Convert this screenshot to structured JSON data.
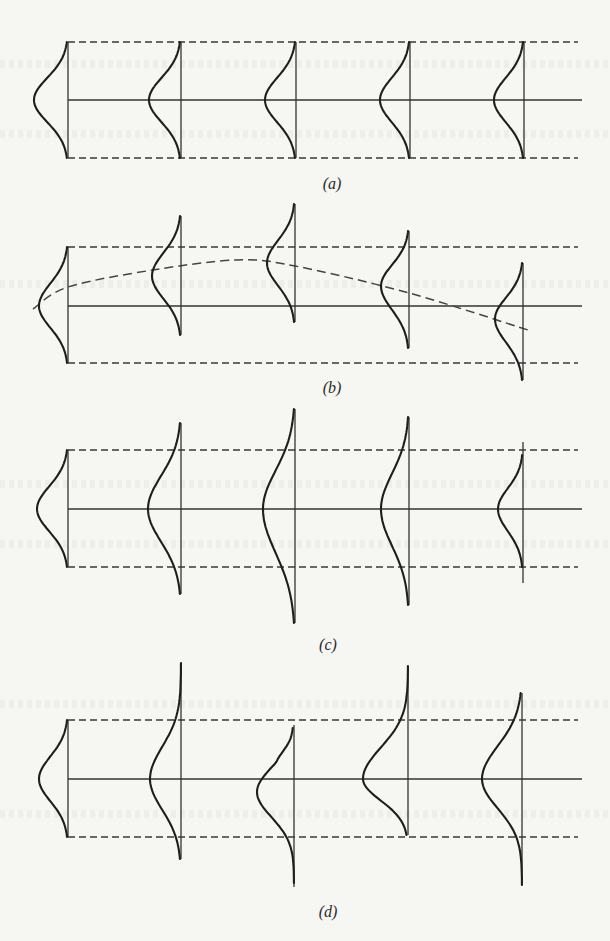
{
  "figure": {
    "width": 610,
    "height": 941,
    "line_color": "#333333",
    "curve_color": "#1e1e1e",
    "background": "#f6f6f3",
    "panels": [
      {
        "id": "a",
        "label": "(a)",
        "label_pos": [
          332,
          184
        ],
        "upper_bound_y": 42,
        "center_y": 100,
        "lower_bound_y": 158,
        "x_start": 68,
        "x_end_dashed": 578,
        "x_end_center": 582,
        "trend": null,
        "distributions": [
          {
            "x": 68,
            "v_top": 42,
            "v_bot": 158,
            "peak_x": 34,
            "peak_y": 100,
            "c_top": 42,
            "c_bot": 158
          },
          {
            "x": 181,
            "v_top": 42,
            "v_bot": 158,
            "peak_x": 149,
            "peak_y": 100,
            "c_top": 42,
            "c_bot": 158
          },
          {
            "x": 296,
            "v_top": 42,
            "v_bot": 158,
            "peak_x": 265,
            "peak_y": 100,
            "c_top": 42,
            "c_bot": 158
          },
          {
            "x": 410,
            "v_top": 42,
            "v_bot": 158,
            "peak_x": 380,
            "peak_y": 100,
            "c_top": 42,
            "c_bot": 158
          },
          {
            "x": 524,
            "v_top": 42,
            "v_bot": 158,
            "peak_x": 494,
            "peak_y": 100,
            "c_top": 42,
            "c_bot": 158
          }
        ]
      },
      {
        "id": "b",
        "label": "(b)",
        "label_pos": [
          332,
          388
        ],
        "upper_bound_y": 247,
        "center_y": 306,
        "lower_bound_y": 363,
        "x_start": 68,
        "x_end_dashed": 578,
        "x_end_center": 582,
        "trend": {
          "points": [
            [
              33,
              309
            ],
            [
              68,
              287
            ],
            [
              153,
              270
            ],
            [
              237,
              260
            ],
            [
              295,
              266
            ],
            [
              409,
              293
            ],
            [
              528,
              330
            ]
          ]
        },
        "distributions": [
          {
            "x": 68,
            "v_top": 247,
            "v_bot": 363,
            "peak_x": 39,
            "peak_y": 306,
            "c_top": 247,
            "c_bot": 363
          },
          {
            "x": 181,
            "v_top": 216,
            "v_bot": 335,
            "peak_x": 152,
            "peak_y": 276,
            "c_top": 216,
            "c_bot": 335
          },
          {
            "x": 295,
            "v_top": 204,
            "v_bot": 322,
            "peak_x": 267,
            "peak_y": 263,
            "c_top": 204,
            "c_bot": 322
          },
          {
            "x": 409,
            "v_top": 231,
            "v_bot": 348,
            "peak_x": 381,
            "peak_y": 286,
            "c_top": 231,
            "c_bot": 348
          },
          {
            "x": 523,
            "v_top": 263,
            "v_bot": 380,
            "peak_x": 495,
            "peak_y": 319,
            "c_top": 263,
            "c_bot": 380
          }
        ]
      },
      {
        "id": "c",
        "label": "(c)",
        "label_pos": [
          328,
          645
        ],
        "upper_bound_y": 450,
        "center_y": 509,
        "lower_bound_y": 567,
        "x_start": 68,
        "x_end_dashed": 578,
        "x_end_center": 582,
        "trend": null,
        "distributions": [
          {
            "x": 68,
            "v_top": 450,
            "v_bot": 567,
            "peak_x": 37,
            "peak_y": 509,
            "c_top": 450,
            "c_bot": 567
          },
          {
            "x": 181,
            "v_top": 423,
            "v_bot": 594,
            "peak_x": 148,
            "peak_y": 509,
            "c_top": 423,
            "c_bot": 594
          },
          {
            "x": 295,
            "v_top": 409,
            "v_bot": 623,
            "peak_x": 263,
            "peak_y": 509,
            "c_top": 409,
            "c_bot": 623
          },
          {
            "x": 409,
            "v_top": 417,
            "v_bot": 605,
            "peak_x": 381,
            "peak_y": 509,
            "c_top": 417,
            "c_bot": 605
          },
          {
            "x": 523,
            "v_top": 442,
            "v_bot": 583,
            "peak_x": 498,
            "peak_y": 509,
            "c_top": 455,
            "c_bot": 567
          }
        ]
      },
      {
        "id": "d",
        "label": "(d)",
        "label_pos": [
          328,
          912
        ],
        "upper_bound_y": 720,
        "center_y": 779,
        "lower_bound_y": 837,
        "x_start": 68,
        "x_end_dashed": 578,
        "x_end_center": 582,
        "trend": null,
        "distributions": [
          {
            "x": 68,
            "v_top": 720,
            "v_bot": 837,
            "peak_x": 39,
            "peak_y": 779,
            "c_top": 720,
            "c_bot": 837
          },
          {
            "x": 181,
            "v_top": 663,
            "v_bot": 859,
            "peak_x": 150,
            "peak_y": 779,
            "c_top": 663,
            "c_bot": 859,
            "skew": "up"
          },
          {
            "x": 294,
            "v_top": 725,
            "v_bot": 887,
            "peak_x": 257,
            "peak_y": 792,
            "c_top": 728,
            "c_bot": 883,
            "skew": "down",
            "shoulder": [
              275,
              768
            ]
          },
          {
            "x": 408,
            "v_top": 666,
            "v_bot": 835,
            "peak_x": 363,
            "peak_y": 779,
            "c_top": 666,
            "c_bot": 835,
            "skew": "up"
          },
          {
            "x": 522,
            "v_top": 693,
            "v_bot": 885,
            "peak_x": 482,
            "peak_y": 779,
            "c_top": 693,
            "c_bot": 885,
            "skew": "down"
          }
        ]
      }
    ]
  }
}
